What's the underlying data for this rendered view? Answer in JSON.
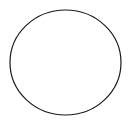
{
  "canvas": {
    "width": 132,
    "height": 124,
    "background_color": "#ffffff",
    "name": "circle-outline-figure"
  },
  "figure": {
    "type": "circle-outline",
    "shape_count": 1
  },
  "shapes": [
    {
      "name": "circle-outline",
      "kind": "ellipse",
      "center_x": 65.5,
      "center_y": 62.5,
      "radius_x": 55.5,
      "radius_y": 52.5,
      "stroke_color": "#1a1a1a",
      "stroke_width": 1.2,
      "fill": "none"
    }
  ]
}
